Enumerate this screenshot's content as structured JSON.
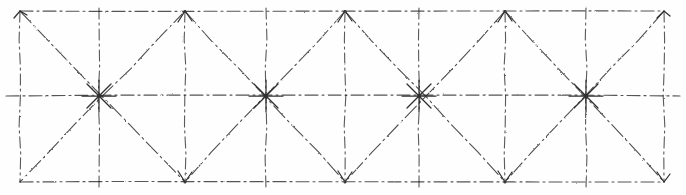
{
  "figure": {
    "kind": "line-drawing",
    "background_color": "#fefefe",
    "ink_color": "#4a4a4a",
    "ink_color_dark": "#2b2b2b",
    "canvas": {
      "width": 686,
      "height": 195
    },
    "line_style": "dash-dot hand-drawn",
    "stroke_width": 1.1
  },
  "chart_data": {
    "type": "diagram",
    "xlabel": "",
    "ylabel": "",
    "xlim": [
      0,
      686
    ],
    "ylim": [
      0,
      195
    ],
    "grid": true,
    "legend": "none",
    "frame": {
      "left": 20,
      "right": 664,
      "top": 11,
      "bottom": 182,
      "midline_y": 96
    },
    "bays": 4,
    "bay_width": 161,
    "nodes": [
      {
        "id": "n-top-0",
        "x": 20,
        "y": 11,
        "type": "corner",
        "marker": "arrow-up"
      },
      {
        "id": "n-top-1",
        "x": 185,
        "y": 11,
        "type": "apex-top",
        "marker": "arrow-up"
      },
      {
        "id": "n-top-2",
        "x": 345,
        "y": 11,
        "type": "apex-top",
        "marker": "arrow-up"
      },
      {
        "id": "n-top-3",
        "x": 505,
        "y": 11,
        "type": "apex-top",
        "marker": "arrow-up"
      },
      {
        "id": "n-top-4",
        "x": 664,
        "y": 11,
        "type": "corner",
        "marker": "arrow-up"
      },
      {
        "id": "n-mid-0",
        "x": 99,
        "y": 96,
        "type": "star",
        "marker": "star-8"
      },
      {
        "id": "n-mid-1",
        "x": 266,
        "y": 96,
        "type": "star",
        "marker": "star-8"
      },
      {
        "id": "n-mid-2",
        "x": 419,
        "y": 96,
        "type": "star",
        "marker": "star-8"
      },
      {
        "id": "n-mid-3",
        "x": 586,
        "y": 96,
        "type": "star",
        "marker": "star-8"
      },
      {
        "id": "n-bot-0",
        "x": 20,
        "y": 182,
        "type": "corner",
        "marker": "none"
      },
      {
        "id": "n-bot-1",
        "x": 185,
        "y": 182,
        "type": "apex-bot",
        "marker": "arrow-down"
      },
      {
        "id": "n-bot-2",
        "x": 345,
        "y": 182,
        "type": "apex-bot",
        "marker": "arrow-down"
      },
      {
        "id": "n-bot-3",
        "x": 505,
        "y": 182,
        "type": "apex-bot",
        "marker": "arrow-down"
      },
      {
        "id": "n-bot-4",
        "x": 664,
        "y": 182,
        "type": "apex-bot",
        "marker": "arrow-down"
      }
    ],
    "horizontal_lines": [
      {
        "id": "h-top",
        "y": 11,
        "x1": 20,
        "x2": 664,
        "label": "top chord"
      },
      {
        "id": "h-mid",
        "y": 96,
        "x1": 6,
        "x2": 680,
        "label": "mid chord"
      },
      {
        "id": "h-bot",
        "y": 182,
        "x1": 20,
        "x2": 664,
        "label": "bottom chord"
      }
    ],
    "vertical_lines": [
      {
        "id": "v-0",
        "x": 20,
        "y1": 11,
        "y2": 182,
        "label": "left edge"
      },
      {
        "id": "v-1",
        "x": 99,
        "y1": 8,
        "y2": 188,
        "label": "post 1"
      },
      {
        "id": "v-2",
        "x": 185,
        "y1": 11,
        "y2": 182,
        "label": "post 2"
      },
      {
        "id": "v-3",
        "x": 266,
        "y1": 8,
        "y2": 188,
        "label": "post 3"
      },
      {
        "id": "v-4",
        "x": 345,
        "y1": 11,
        "y2": 182,
        "label": "post 4"
      },
      {
        "id": "v-5",
        "x": 419,
        "y1": 8,
        "y2": 188,
        "label": "post 5"
      },
      {
        "id": "v-6",
        "x": 505,
        "y1": 11,
        "y2": 182,
        "label": "post 6"
      },
      {
        "id": "v-7",
        "x": 586,
        "y1": 8,
        "y2": 188,
        "label": "post 7"
      },
      {
        "id": "v-8",
        "x": 664,
        "y1": 11,
        "y2": 182,
        "label": "right edge"
      }
    ],
    "diagonals_upper": [
      {
        "id": "d-u-1",
        "x1": 20,
        "y1": 11,
        "x2": 185,
        "y2": 182
      },
      {
        "id": "d-u-2",
        "x1": 185,
        "y1": 11,
        "x2": 20,
        "y2": 182
      },
      {
        "id": "d-u-3",
        "x1": 185,
        "y1": 11,
        "x2": 345,
        "y2": 182
      },
      {
        "id": "d-u-4",
        "x1": 345,
        "y1": 11,
        "x2": 185,
        "y2": 182
      },
      {
        "id": "d-u-5",
        "x1": 345,
        "y1": 11,
        "x2": 505,
        "y2": 182
      },
      {
        "id": "d-u-6",
        "x1": 505,
        "y1": 11,
        "x2": 345,
        "y2": 182
      },
      {
        "id": "d-u-7",
        "x1": 505,
        "y1": 11,
        "x2": 664,
        "y2": 182
      },
      {
        "id": "d-u-8",
        "x1": 664,
        "y1": 11,
        "x2": 505,
        "y2": 182
      }
    ]
  }
}
